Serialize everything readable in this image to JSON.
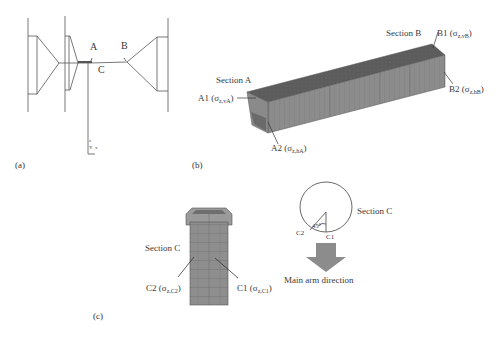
{
  "panels": {
    "a": {
      "tag": "(a)",
      "points": {
        "A": "A",
        "B": "B",
        "C": "C"
      },
      "axes": {
        "z": "z",
        "y": "Y",
        "x": "x"
      }
    },
    "b": {
      "tag": "(b)",
      "section_a": "Section A",
      "section_b": "Section B",
      "A1": {
        "name": "A1",
        "sigma": "σ",
        "sub": "z,vA"
      },
      "A2": {
        "name": "A2",
        "sigma": "σ",
        "sub": "z,hA"
      },
      "B1": {
        "name": "B1",
        "sigma": "σ",
        "sub": "z,vB"
      },
      "B2": {
        "name": "B2",
        "sigma": "σ",
        "sub": "z,hB"
      }
    },
    "c": {
      "tag": "(c)",
      "section_c_tower": "Section C",
      "section_c_circle": "Section C",
      "C1": {
        "name": "C1",
        "sigma": "σ",
        "sub": "z,C1"
      },
      "C2": {
        "name": "C2",
        "sigma": "σ",
        "sub": "z,C2"
      },
      "circle_c1": "C1",
      "circle_c2": "C2",
      "angle": "45°",
      "arrow_label": "Main arm direction"
    }
  },
  "colors": {
    "mesh_top": "#5e5e5e",
    "mesh_side": "#8a8a8a",
    "line": "#444444",
    "arrow": "#8c8c8c"
  }
}
